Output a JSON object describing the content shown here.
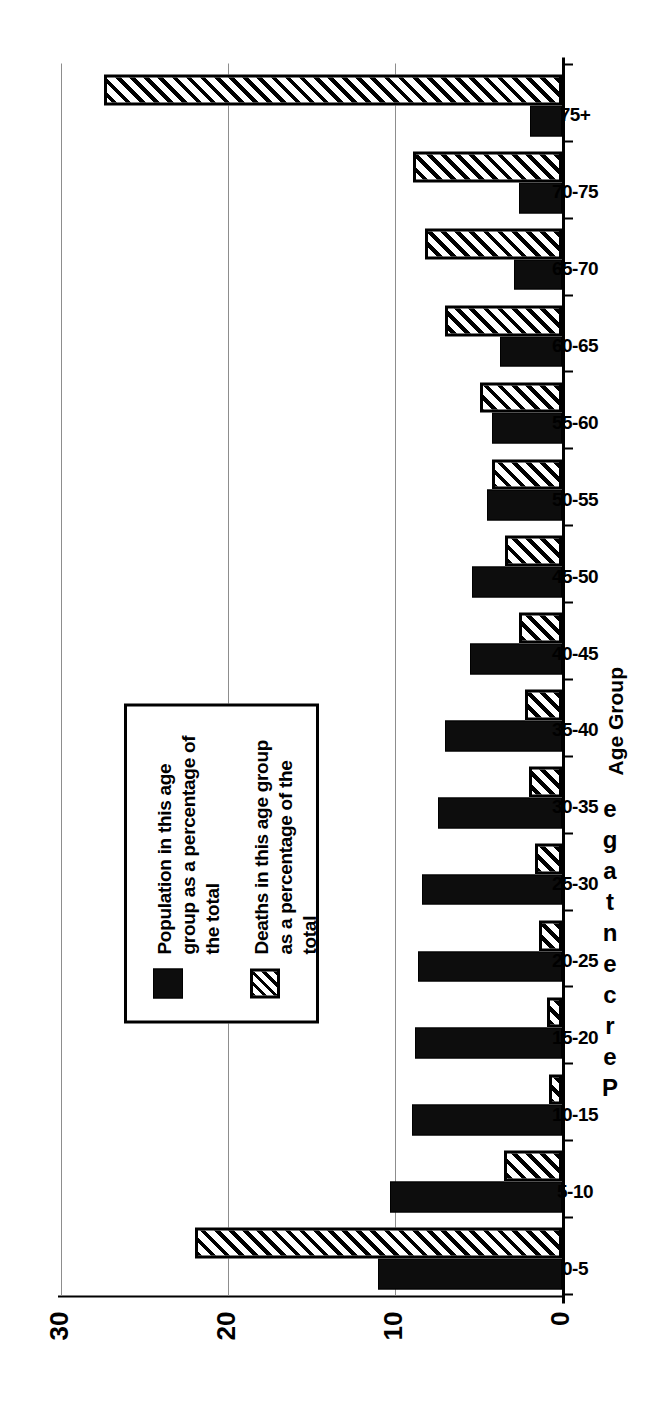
{
  "figure": {
    "orientation": "rotated-90-ccw",
    "legend": {
      "entries": [
        {
          "swatch": "solid-black-square",
          "label": "Population in this age group as a percentage of the total"
        },
        {
          "swatch": "diagonal-hatch-square",
          "label": "Deaths in this age group as a percentage of the total"
        }
      ]
    },
    "axis_titles": {
      "category": "Age Group",
      "value": "Percentage",
      "value_letters": [
        "P",
        "e",
        "r",
        "c",
        "e",
        "n",
        "t",
        "a",
        "g",
        "e"
      ]
    }
  },
  "chart_data": {
    "type": "bar",
    "title": "",
    "xlabel": "Age Group",
    "ylabel": "Percentage",
    "ylim": [
      0,
      30
    ],
    "yticks": [
      0,
      10,
      20,
      30
    ],
    "ytick_labels": [
      "0",
      "10",
      "20",
      "30"
    ],
    "grid": true,
    "legend_position": "inside-upper-left",
    "categories": [
      "0-5",
      "5-10",
      "10-15",
      "15-20",
      "20-25",
      "25-30",
      "30-35",
      "35-40",
      "40-45",
      "45-50",
      "50-55",
      "55-60",
      "60-65",
      "65-70",
      "70-75",
      "75+"
    ],
    "series": [
      {
        "name": "Population in this age group as a percentage of the total",
        "style": "solid-black",
        "color": "#0d0d0d",
        "values": [
          11.0,
          10.3,
          9.0,
          8.8,
          8.6,
          8.4,
          7.4,
          7.0,
          5.5,
          5.4,
          4.5,
          4.2,
          3.7,
          2.9,
          2.6,
          1.9
        ]
      },
      {
        "name": "Deaths in this age group as a percentage of the total",
        "style": "diagonal-hatch",
        "color": "#000000",
        "values": [
          22.0,
          3.5,
          0.8,
          0.9,
          1.4,
          1.6,
          2.0,
          2.2,
          2.6,
          3.4,
          4.2,
          4.9,
          7.0,
          8.2,
          8.9,
          27.4
        ]
      }
    ]
  }
}
